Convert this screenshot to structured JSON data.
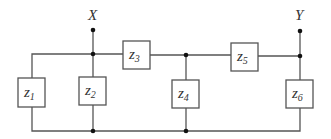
{
  "diagram": {
    "type": "circuit-ladder-network",
    "nodes": [
      {
        "id": "X",
        "label": "X",
        "x": 93,
        "label_y": 20,
        "terminal_y": 30,
        "junction_y": 54
      },
      {
        "id": "Y",
        "label": "Y",
        "x": 300,
        "label_y": 20,
        "terminal_y": 31,
        "junction_y": 56
      }
    ],
    "components": [
      {
        "id": "z1",
        "main": "z",
        "sub": "1",
        "orientation": "vertical",
        "x": 18,
        "y": 78,
        "w": 27,
        "h": 29
      },
      {
        "id": "z2",
        "main": "z",
        "sub": "2",
        "orientation": "vertical",
        "x": 79,
        "y": 77,
        "w": 27,
        "h": 28
      },
      {
        "id": "z3",
        "main": "z",
        "sub": "3",
        "orientation": "horizontal",
        "x": 123,
        "y": 41,
        "w": 27,
        "h": 28
      },
      {
        "id": "z4",
        "main": "z",
        "sub": "4",
        "orientation": "vertical",
        "x": 172,
        "y": 80,
        "w": 27,
        "h": 28
      },
      {
        "id": "z5",
        "main": "z",
        "sub": "5",
        "orientation": "horizontal",
        "x": 231,
        "y": 43,
        "w": 27,
        "h": 28
      },
      {
        "id": "z6",
        "main": "z",
        "sub": "6",
        "orientation": "vertical",
        "x": 286,
        "y": 80,
        "w": 27,
        "h": 28
      }
    ],
    "colors": {
      "wire": "#555555",
      "dot": "#111111",
      "text": "#333333",
      "background": "#ffffff"
    }
  }
}
